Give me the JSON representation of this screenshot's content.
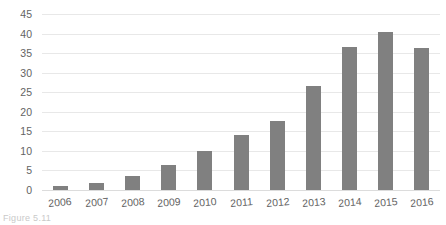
{
  "chart_data": {
    "type": "bar",
    "title": "",
    "subtitle": "",
    "xlabel": "",
    "ylabel": "",
    "categories": [
      "2006",
      "2007",
      "2008",
      "2009",
      "2010",
      "2011",
      "2012",
      "2013",
      "2014",
      "2015",
      "2016"
    ],
    "values": [
      1,
      1.8,
      3.6,
      6.3,
      10.1,
      14,
      17.7,
      26.6,
      36.5,
      40.5,
      36.2
    ],
    "series": [
      {
        "name": "",
        "values": [
          1,
          1.8,
          3.6,
          6.3,
          10.1,
          14,
          17.7,
          26.6,
          36.5,
          40.5,
          36.2
        ]
      }
    ],
    "ylim": [
      0,
      45
    ],
    "ytick_values": [
      0,
      5,
      10,
      15,
      20,
      25,
      30,
      35,
      40,
      45
    ],
    "ytick_labels": [
      "0",
      "5",
      "10",
      "15",
      "20",
      "25",
      "30",
      "35",
      "40",
      "45"
    ],
    "grid": true,
    "grid_axis": "y",
    "legend": false,
    "legend_position": "none",
    "bar_color": "#808080",
    "gridline_color": "#e8e8e8",
    "background_color": "#ffffff",
    "text_color": "#636363"
  },
  "caption": {
    "text": "Figure 5.11"
  }
}
